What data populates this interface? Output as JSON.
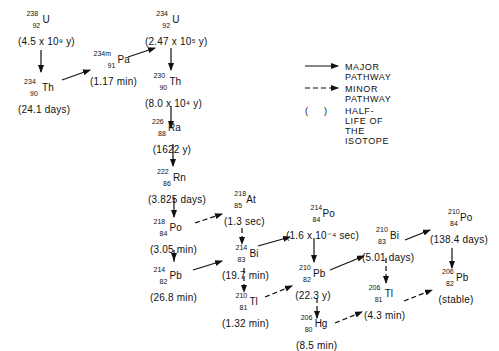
{
  "nuclides": [
    {
      "id": "u238",
      "mass": "238",
      "z": "92",
      "symbol": "U",
      "half_life": "(4.5 x 10⁹ y)"
    },
    {
      "id": "th234",
      "mass": "234",
      "z": "90",
      "symbol": "Th",
      "half_life": "(24.1 days)"
    },
    {
      "id": "pa234m",
      "mass": "234m",
      "z": "91",
      "symbol": "Pa",
      "half_life": "(1.17 min)"
    },
    {
      "id": "u234",
      "mass": "234",
      "z": "92",
      "symbol": "U",
      "half_life": "(2.47 x 10⁵ y)"
    },
    {
      "id": "th230",
      "mass": "230",
      "z": "90",
      "symbol": "Th",
      "half_life": "(8.0 x 10⁴ y)"
    },
    {
      "id": "ra226",
      "mass": "226",
      "z": "88",
      "symbol": "Ra",
      "half_life": "(1622 y)"
    },
    {
      "id": "rn222",
      "mass": "222",
      "z": "86",
      "symbol": "Rn",
      "half_life": "(3.825 days)"
    },
    {
      "id": "po218",
      "mass": "218",
      "z": "84",
      "symbol": "Po",
      "half_life": "(3.05 min)"
    },
    {
      "id": "at218",
      "mass": "218",
      "z": "85",
      "symbol": "At",
      "half_life": "(1.3 sec)"
    },
    {
      "id": "pb214",
      "mass": "214",
      "z": "82",
      "symbol": "Pb",
      "half_life": "(26.8 min)"
    },
    {
      "id": "bi214",
      "mass": "214",
      "z": "83",
      "symbol": "Bi",
      "half_life": "(19.7 min)"
    },
    {
      "id": "po214",
      "mass": "214",
      "z": "84",
      "symbol": "Po",
      "half_life": "(1.6 x 10⁻⁴ sec)"
    },
    {
      "id": "tl210",
      "mass": "210",
      "z": "81",
      "symbol": "Tl",
      "half_life": "(1.32 min)"
    },
    {
      "id": "pb210",
      "mass": "210",
      "z": "82",
      "symbol": "Pb",
      "half_life": "(22.3 y)"
    },
    {
      "id": "hg206",
      "mass": "206",
      "z": "80",
      "symbol": "Hg",
      "half_life": "(8.5 min)"
    },
    {
      "id": "bi210",
      "mass": "210",
      "z": "83",
      "symbol": "Bi",
      "half_life": "(5.01 days)"
    },
    {
      "id": "tl206",
      "mass": "206",
      "z": "81",
      "symbol": "Tl",
      "half_life": "(4.3 min)"
    },
    {
      "id": "po210",
      "mass": "210",
      "z": "84",
      "symbol": "Po",
      "half_life": "(138.4 days)"
    },
    {
      "id": "pb206",
      "mass": "206",
      "z": "82",
      "symbol": "Pb",
      "half_life": "(stable)"
    }
  ],
  "legend": {
    "major": "MAJOR PATHWAY",
    "minor": "MINOR PATHWAY",
    "paren_symbol": "(     )",
    "halflife": "HALF-LIFE OF THE ISOTOPE"
  },
  "colors": {
    "ink": "#111111",
    "background": "#ffffff"
  }
}
